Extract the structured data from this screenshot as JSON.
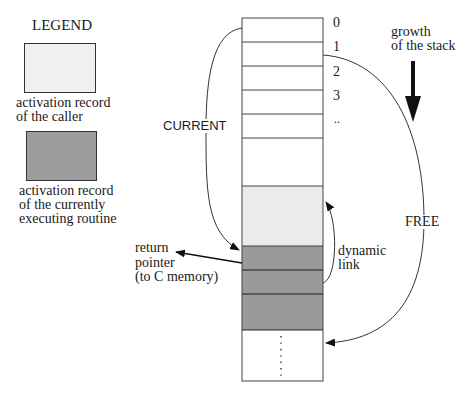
{
  "legend": {
    "title": "LEGEND",
    "items": [
      {
        "label_line1": "activation record",
        "label_line2": "of the caller",
        "label_line3": "",
        "fill": "#f0f0f0"
      },
      {
        "label_line1": "activation record",
        "label_line2": "of the currently",
        "label_line3": "executing routine",
        "fill": "#9c9c9c"
      }
    ]
  },
  "stack": {
    "index_labels": [
      "0",
      "1",
      "2",
      "3",
      ".."
    ],
    "colors": {
      "caller": "#ebebeb",
      "current": "#9a9a9a",
      "free": "#ffffff",
      "border": "#444444"
    }
  },
  "labels": {
    "current": "CURRENT",
    "free": "FREE",
    "growth_line1": "growth",
    "growth_line2": "of the stack",
    "dynamic_line1": "dynamic",
    "dynamic_line2": "link",
    "return_line1": "return",
    "return_line2": "pointer",
    "return_line3": "(to C memory)"
  }
}
